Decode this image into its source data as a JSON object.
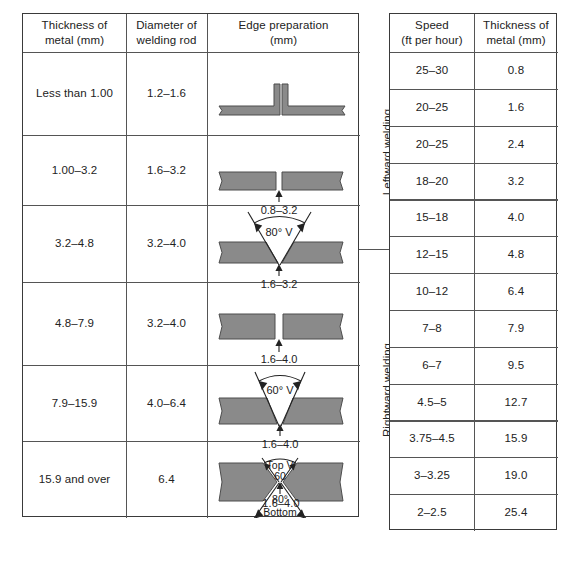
{
  "left_table": {
    "headers": [
      "Thickness of\nmetal (mm)",
      "Diameter of\nwelding rod",
      "Edge preparation\n(mm)"
    ],
    "header_lines": {
      "c0l1": "Thickness of",
      "c0l2": "metal (mm)",
      "c1l1": "Diameter of",
      "c1l2": "welding rod",
      "c2l1": "Edge preparation",
      "c2l2": "(mm)"
    },
    "rows": [
      {
        "thickness": "Less than 1.00",
        "rod_diameter": "1.2–1.6",
        "edge_type": "flanged-butt",
        "gap_label": "",
        "angle_label": ""
      },
      {
        "thickness": "1.00–3.2",
        "rod_diameter": "1.6–3.2",
        "edge_type": "square-butt",
        "gap_label": "0.8–3.2",
        "angle_label": ""
      },
      {
        "thickness": "3.2–4.8",
        "rod_diameter": "3.2–4.0",
        "edge_type": "single-v",
        "gap_label": "1.6–3.2",
        "angle_label": "80° V"
      },
      {
        "thickness": "4.8–7.9",
        "rod_diameter": "3.2–4.0",
        "edge_type": "square-butt",
        "gap_label": "1.6–4.0",
        "angle_label": ""
      },
      {
        "thickness": "7.9–15.9",
        "rod_diameter": "4.0–6.4",
        "edge_type": "single-v",
        "gap_label": "1.6–4.0",
        "angle_label": "60° V"
      },
      {
        "thickness": "15.9 and over",
        "rod_diameter": "6.4",
        "edge_type": "double-v",
        "gap_label": "1.6–4.0",
        "angle_label_top1": "Top V",
        "angle_label_top2": "60",
        "angle_label_bottom1": "80°",
        "angle_label_bottom2": "Bottom"
      }
    ]
  },
  "group_labels": {
    "leftward": "Leftward welding",
    "rightward": "Rightward welding"
  },
  "right_table": {
    "headers": [
      "Speed\n(ft per hour)",
      "Thickness of\nmetal (mm)"
    ],
    "header_lines": {
      "c0l1": "Speed",
      "c0l2": "(ft per hour)",
      "c1l1": "Thickness of",
      "c1l2": "metal (mm)"
    },
    "rows": [
      {
        "speed": "25–30",
        "thickness": "0.8"
      },
      {
        "speed": "20–25",
        "thickness": "1.6"
      },
      {
        "speed": "20–25",
        "thickness": "2.4"
      },
      {
        "speed": "18–20",
        "thickness": "3.2"
      },
      {
        "speed": "15–18",
        "thickness": "4.0"
      },
      {
        "speed": "12–15",
        "thickness": "4.8"
      },
      {
        "speed": "10–12",
        "thickness": "6.4"
      },
      {
        "speed": "7–8",
        "thickness": "7.9"
      },
      {
        "speed": "6–7",
        "thickness": "9.5"
      },
      {
        "speed": "4.5–5",
        "thickness": "12.7"
      },
      {
        "speed": "3.75–4.5",
        "thickness": "15.9"
      },
      {
        "speed": "3–3.25",
        "thickness": "19.0"
      },
      {
        "speed": "2–2.5",
        "thickness": "25.4"
      }
    ]
  },
  "colors": {
    "plate_fill": "#8a8a8a",
    "plate_edge": "#4d4d4d",
    "border": "#3a3a3a",
    "grid": "#555555",
    "text": "#222222"
  }
}
